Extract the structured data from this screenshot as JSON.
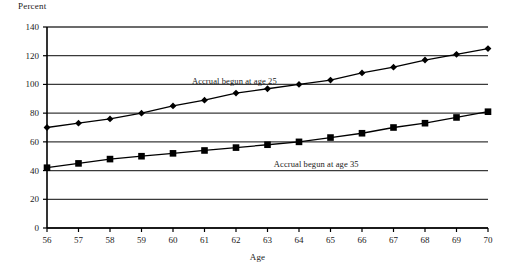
{
  "chart_data": {
    "type": "line",
    "title": "",
    "xlabel": "Age",
    "ylabel": "Percent",
    "xlim": [
      56,
      70
    ],
    "ylim": [
      0,
      140
    ],
    "xticks": [
      56,
      57,
      58,
      59,
      60,
      61,
      62,
      63,
      64,
      65,
      66,
      67,
      68,
      69,
      70
    ],
    "yticks": [
      0,
      20,
      40,
      60,
      80,
      100,
      120,
      140
    ],
    "grid": "horizontal",
    "legend_position": "inline-annotation",
    "x": [
      56,
      57,
      58,
      59,
      60,
      61,
      62,
      63,
      64,
      65,
      66,
      67,
      68,
      69,
      70
    ],
    "series": [
      {
        "name": "Accrual begun at age 25",
        "marker": "diamond",
        "annotation": "Accrual begun at age 25",
        "values": [
          70,
          73,
          76,
          80,
          85,
          89,
          94,
          97,
          100,
          103,
          108,
          112,
          117,
          121,
          125
        ]
      },
      {
        "name": "Accrual begun at age 35",
        "marker": "square",
        "annotation": "Accrual begun at age 35",
        "values": [
          42,
          45,
          48,
          50,
          52,
          54,
          56,
          58,
          60,
          63,
          66,
          70,
          73,
          77,
          81
        ]
      }
    ]
  },
  "axes": {
    "y_title": "Percent",
    "x_title": "Age",
    "y_tick_labels": [
      "140",
      "120",
      "100",
      "80",
      "60",
      "40",
      "20",
      "0"
    ],
    "x_tick_labels": [
      "56",
      "57",
      "58",
      "59",
      "60",
      "61",
      "62",
      "63",
      "64",
      "65",
      "66",
      "67",
      "68",
      "69",
      "70"
    ]
  },
  "annotations": {
    "upper_series": "Accrual begun at age 25",
    "lower_series": "Accrual begun at age 35"
  },
  "colors": {
    "series_line": "#000000",
    "marker": "#000000",
    "gridline": "#3a3a3a",
    "axis": "#000000",
    "background": "#ffffff"
  }
}
